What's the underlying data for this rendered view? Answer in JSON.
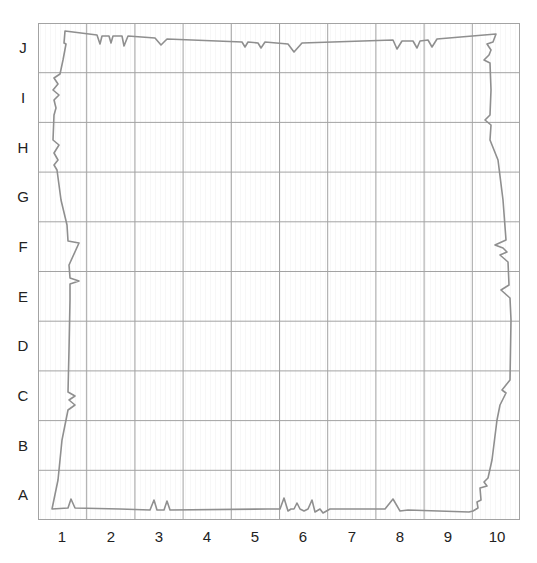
{
  "grid": {
    "rows": [
      "J",
      "I",
      "H",
      "G",
      "F",
      "E",
      "D",
      "C",
      "B",
      "A"
    ],
    "columns": [
      "1",
      "2",
      "3",
      "4",
      "5",
      "6",
      "7",
      "8",
      "9",
      "10"
    ],
    "left": 38,
    "top": 23,
    "right": 520,
    "bottom": 520,
    "line_color": "#9a9a9a",
    "hatch_color": "#ececec",
    "border_path_color": "#8f8f8f"
  },
  "labels": {
    "row_J": "J",
    "row_I": "I",
    "row_H": "H",
    "row_G": "G",
    "row_F": "F",
    "row_E": "E",
    "row_D": "D",
    "row_C": "C",
    "row_B": "B",
    "row_A": "A",
    "col_1": "1",
    "col_2": "2",
    "col_3": "3",
    "col_4": "4",
    "col_5": "5",
    "col_6": "6",
    "col_7": "7",
    "col_8": "8",
    "col_9": "9",
    "col_10": "10"
  }
}
